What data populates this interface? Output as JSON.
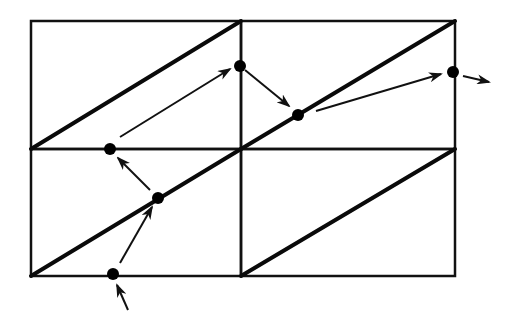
{
  "diagram": {
    "colors": {
      "background": "#ffffff",
      "lines": "#111111",
      "points": "#000000"
    },
    "grid": {
      "rows": 2,
      "cols": 2,
      "x0": 31,
      "y0": 21,
      "x1": 455,
      "y1": 276,
      "xmid": 241,
      "ymid": 149
    },
    "points": [
      {
        "id": "p1",
        "x": 113,
        "y": 274
      },
      {
        "id": "p2",
        "x": 158,
        "y": 198
      },
      {
        "id": "p3",
        "x": 110,
        "y": 149
      },
      {
        "id": "p4",
        "x": 240,
        "y": 66
      },
      {
        "id": "p5",
        "x": 298,
        "y": 115
      },
      {
        "id": "p6",
        "x": 453,
        "y": 72
      }
    ],
    "arrows": [
      {
        "id": "a0",
        "from": [
          128,
          310
        ],
        "to": [
          117,
          285
        ]
      },
      {
        "id": "a1",
        "from": [
          120,
          263
        ],
        "to": [
          152,
          207
        ]
      },
      {
        "id": "a2",
        "from": [
          150,
          190
        ],
        "to": [
          118,
          158
        ]
      },
      {
        "id": "a3",
        "from": [
          120,
          137
        ],
        "to": [
          230,
          69
        ]
      },
      {
        "id": "a4",
        "from": [
          245,
          70
        ],
        "to": [
          289,
          106
        ]
      },
      {
        "id": "a5",
        "from": [
          316,
          111
        ],
        "to": [
          441,
          74
        ]
      },
      {
        "id": "a6",
        "from": [
          463,
          76
        ],
        "to": [
          489,
          82
        ]
      }
    ]
  }
}
